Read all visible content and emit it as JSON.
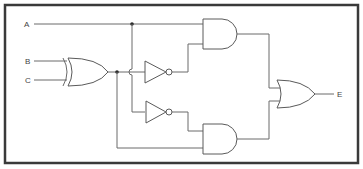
{
  "diagram": {
    "type": "logic-circuit",
    "inputs": [
      {
        "label": "A"
      },
      {
        "label": "B"
      },
      {
        "label": "C"
      }
    ],
    "output": {
      "label": "E"
    },
    "gates": [
      {
        "id": "xor1",
        "type": "XOR",
        "inputs": [
          "B",
          "C"
        ]
      },
      {
        "id": "not1",
        "type": "NOT",
        "inputs": [
          "xor1"
        ]
      },
      {
        "id": "not2",
        "type": "NOT",
        "inputs": [
          "A"
        ]
      },
      {
        "id": "and1",
        "type": "AND",
        "inputs": [
          "A",
          "not1"
        ]
      },
      {
        "id": "and2",
        "type": "AND",
        "inputs": [
          "not2",
          "xor1"
        ]
      },
      {
        "id": "or1",
        "type": "OR",
        "inputs": [
          "and1",
          "and2"
        ],
        "output": "E"
      }
    ],
    "colors": {
      "line": "#6a6a6a",
      "frame": "#3a3a3a",
      "background": "#ffffff"
    }
  }
}
